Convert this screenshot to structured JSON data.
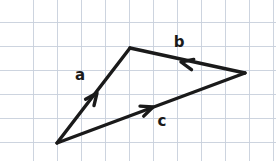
{
  "figure": {
    "name": "vector-triangle-diagram",
    "width": 276,
    "height": 161,
    "background_color": "#ffffff",
    "ink_color": "#1a1a1a",
    "grid_color": "#c8cfdc"
  },
  "grid": {
    "spacing": 24,
    "x_lines": [
      33,
      57,
      81,
      105,
      129,
      153,
      177,
      201,
      225,
      249,
      273
    ],
    "y_lines": [
      22,
      46,
      70,
      94,
      118,
      142
    ],
    "visible": true
  },
  "vertices": {
    "bottom_left": {
      "x": 57,
      "y": 143
    },
    "top": {
      "x": 130,
      "y": 48
    },
    "right": {
      "x": 245,
      "y": 73
    }
  },
  "vectors": [
    {
      "id": "a",
      "label": "a",
      "from": "bottom_left",
      "to": "top",
      "x1": 57,
      "y1": 143,
      "x2": 130,
      "y2": 48,
      "stroke_width": 3.4,
      "arrow": {
        "x": 97,
        "y": 93,
        "angle_deg": -52.5,
        "size": 13
      },
      "label_pos": {
        "x": 80,
        "y": 75
      }
    },
    {
      "id": "b",
      "label": "b",
      "from": "right",
      "to": "top",
      "x1": 245,
      "y1": 73,
      "x2": 130,
      "y2": 48,
      "stroke_width": 3.4,
      "arrow": {
        "x": 181,
        "y": 62,
        "angle_deg": 192.3,
        "size": 13
      },
      "label_pos": {
        "x": 179,
        "y": 42
      }
    },
    {
      "id": "c",
      "label": "c",
      "from": "bottom_left",
      "to": "right",
      "x1": 57,
      "y1": 143,
      "x2": 245,
      "y2": 73,
      "stroke_width": 3.4,
      "arrow": {
        "x": 153,
        "y": 107,
        "angle_deg": -20.4,
        "size": 13
      },
      "label_pos": {
        "x": 162,
        "y": 121
      }
    }
  ]
}
